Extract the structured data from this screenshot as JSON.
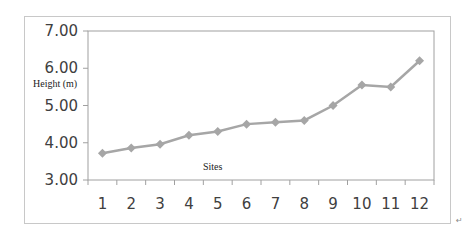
{
  "chart_data": {
    "type": "line",
    "title": "",
    "xlabel": "Sites",
    "ylabel": "Height (m)",
    "categories": [
      "1",
      "2",
      "3",
      "4",
      "5",
      "6",
      "7",
      "8",
      "9",
      "10",
      "11",
      "12"
    ],
    "series": [
      {
        "name": "Height (m)",
        "values": [
          3.72,
          3.86,
          3.96,
          4.2,
          4.3,
          4.5,
          4.55,
          4.6,
          5.0,
          5.55,
          5.5,
          6.2
        ],
        "color": "#a6a6a6",
        "marker": "diamond"
      }
    ],
    "ylim": [
      3.0,
      7.0
    ],
    "yticks": [
      "3.00",
      "4.00",
      "5.00",
      "6.00",
      "7.00"
    ],
    "grid": false,
    "legend": "none"
  },
  "annotations": {
    "return_mark": "↵"
  }
}
